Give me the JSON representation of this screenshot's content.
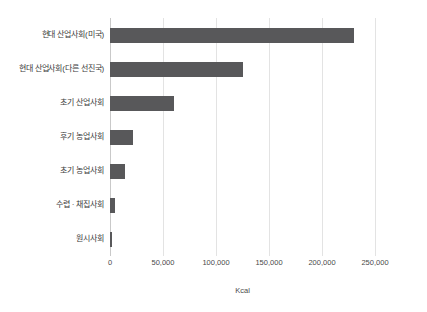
{
  "chart_data": {
    "type": "bar",
    "orientation": "horizontal",
    "title": "",
    "xlabel": "Kcal",
    "ylabel": "",
    "categories": [
      "현대 산업사회(미국)",
      "현대 산업사회(다른 선진국)",
      "초기 산업사회",
      "후기 농업사회",
      "초기 농업사회",
      "수렵 · 채집사회",
      "원시사회"
    ],
    "values": [
      230000,
      125000,
      60000,
      22000,
      14000,
      5000,
      2000
    ],
    "xlim": [
      0,
      250000
    ],
    "xticks": [
      0,
      50000,
      100000,
      150000,
      200000,
      250000
    ],
    "xtick_labels": [
      "0",
      "50,000",
      "100,000",
      "150,000",
      "200,000",
      "250,000"
    ],
    "grid": true,
    "legend": "none",
    "bar_color": "#58585a",
    "gridline_color": "#e3e3e3",
    "background_color": "#ffffff"
  }
}
